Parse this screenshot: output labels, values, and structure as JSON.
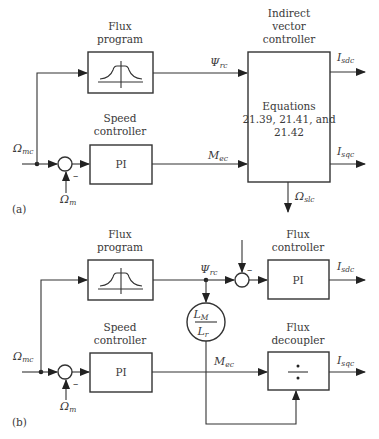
{
  "diagram_a": {
    "panel_label": "(a)",
    "flux_program": {
      "title_line1": "Flux",
      "title_line2": "program",
      "icon": "flux-weakening-curve-icon"
    },
    "speed_controller": {
      "title_line1": "Speed",
      "title_line2": "controller",
      "body": "PI"
    },
    "input_label": {
      "main": "Ω",
      "sub": "mc"
    },
    "feedback_label": {
      "main": "Ω",
      "sub": "m"
    },
    "sum_sign": "–",
    "indirect_vector_controller": {
      "title_line1": "Indirect",
      "title_line2": "vector",
      "title_line3": "controller",
      "body_line1": "Equations",
      "body_line2": "21.39, 21.41, and",
      "body_line3": "21.42"
    },
    "psi_label": {
      "main": "Ψ",
      "sub": "rc"
    },
    "torque_label": {
      "main": "M",
      "sub": "ec"
    },
    "isd_label": {
      "main": "I",
      "sub": "sdc"
    },
    "isq_label": {
      "main": "I",
      "sub": "sqc"
    },
    "slip_label": {
      "main": "Ω",
      "sub": "slc"
    }
  },
  "diagram_b": {
    "panel_label": "(b)",
    "flux_program": {
      "title_line1": "Flux",
      "title_line2": "program",
      "icon": "flux-weakening-curve-icon"
    },
    "speed_controller": {
      "title_line1": "Speed",
      "title_line2": "controller",
      "body": "PI"
    },
    "input_label": {
      "main": "Ω",
      "sub": "mc"
    },
    "feedback_label": {
      "main": "Ω",
      "sub": "m"
    },
    "sum_sign": "–",
    "psi_label": {
      "main": "Ψ",
      "sub": "rc"
    },
    "flux_controller": {
      "title_line1": "Flux",
      "title_line2": "controller",
      "body": "PI",
      "sum_sign": "–"
    },
    "gain_block": {
      "num_main": "L",
      "num_sub": "M",
      "den_main": "L",
      "den_sub": "r"
    },
    "flux_decoupler": {
      "title_line1": "Flux",
      "title_line2": "decoupler",
      "body": "÷"
    },
    "torque_label": {
      "main": "M",
      "sub": "ec"
    },
    "isd_label": {
      "main": "I",
      "sub": "sdc"
    },
    "isq_label": {
      "main": "I",
      "sub": "sqc"
    }
  }
}
